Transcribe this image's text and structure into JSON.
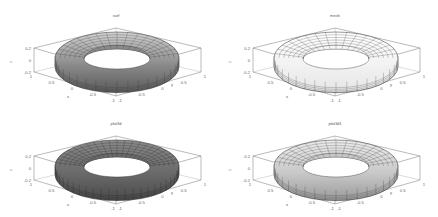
{
  "figure": {
    "background": "#ffffff",
    "layout": "2x2"
  },
  "chart_data": [
    {
      "type": "surface",
      "title": "surf",
      "surface": "torus",
      "style": "shaded surface with mesh lines",
      "face_color": "#9a9a9a",
      "xlabel": "x",
      "ylabel": "y",
      "zlabel": "z",
      "xticks": [
        "1",
        "0.5",
        "0",
        "-0.5",
        "-1"
      ],
      "yticks": [
        "1",
        "0.5",
        "0",
        "-0.5",
        "-1"
      ],
      "zticks": [
        "0.2",
        "0",
        "-0.2"
      ],
      "xlim": [
        -1,
        1
      ],
      "ylim": [
        -1,
        1
      ],
      "zlim": [
        -0.2,
        0.2
      ]
    },
    {
      "type": "surface",
      "title": "mesh",
      "surface": "torus",
      "style": "wireframe mesh",
      "face_color": "#f4f4f4",
      "xlabel": "x",
      "ylabel": "y",
      "zlabel": "z",
      "xticks": [
        "1",
        "0.5",
        "0",
        "-0.5",
        "-1"
      ],
      "yticks": [
        "1",
        "0.5",
        "0",
        "-0.5",
        "-1"
      ],
      "zticks": [
        "0.2",
        "0",
        "-0.2"
      ],
      "xlim": [
        -1,
        1
      ],
      "ylim": [
        -1,
        1
      ],
      "zlim": [
        -0.2,
        0.2
      ]
    },
    {
      "type": "surface",
      "title": "plot3d",
      "surface": "torus",
      "style": "dark shaded surface with dense mesh",
      "face_color": "#6e6e6e",
      "xlabel": "x",
      "ylabel": "y",
      "zlabel": "z",
      "xticks": [
        "1",
        "0.5",
        "0",
        "-0.5",
        "-1"
      ],
      "yticks": [
        "1",
        "0.5",
        "0",
        "-0.5",
        "-1"
      ],
      "zticks": [
        "0.2",
        "0",
        "-0.2"
      ],
      "xlim": [
        -1,
        1
      ],
      "ylim": [
        -1,
        1
      ],
      "zlim": [
        -0.2,
        0.2
      ]
    },
    {
      "type": "surface",
      "title": "plot3d1",
      "surface": "torus",
      "style": "light gradient shaded surface with mesh",
      "face_color": "#c4c4c4",
      "xlabel": "x",
      "ylabel": "y",
      "zlabel": "z",
      "xticks": [
        "1",
        "0.5",
        "0",
        "-0.5",
        "-1"
      ],
      "yticks": [
        "1",
        "0.5",
        "0",
        "-0.5",
        "-1"
      ],
      "zticks": [
        "0.2",
        "0",
        "-0.2"
      ],
      "xlim": [
        -1,
        1
      ],
      "ylim": [
        -1,
        1
      ],
      "zlim": [
        -0.2,
        0.2
      ]
    }
  ]
}
